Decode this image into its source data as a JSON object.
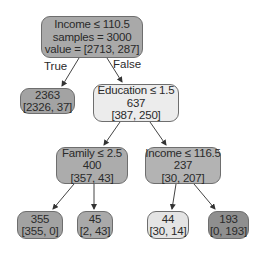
{
  "diagram": {
    "type": "decision-tree",
    "edge_labels": {
      "true": "True",
      "false": "False"
    },
    "colors": {
      "root": "#a9a9a9",
      "leaf_left": "#a3a3a3",
      "education": "#ececec",
      "family": "#acacac",
      "income2": "#b3b3b3",
      "leaf_355": "#a2a2a2",
      "leaf_45": "#a9a9a9",
      "leaf_44": "#e4e4e4",
      "leaf_193": "#8f8f8f",
      "border": "#6e6e6e",
      "edge": "#444444"
    },
    "nodes": {
      "root": {
        "line1": "Income ≤ 110.5",
        "line2": "samples = 3000",
        "line3": "value = [2713, 287]"
      },
      "leaf_left": {
        "line1": "2363",
        "line2": "[2326, 37]"
      },
      "education": {
        "line1": "Education ≤ 1.5",
        "line2": "637",
        "line3": "[387, 250]"
      },
      "family": {
        "line1": "Family ≤ 2.5",
        "line2": "400",
        "line3": "[357, 43]"
      },
      "income2": {
        "line1": "Income ≤ 116.5",
        "line2": "237",
        "line3": "[30, 207]"
      },
      "leaf_355": {
        "line1": "355",
        "line2": "[355, 0]"
      },
      "leaf_45": {
        "line1": "45",
        "line2": "[2, 43]"
      },
      "leaf_44": {
        "line1": "44",
        "line2": "[30, 14]"
      },
      "leaf_193": {
        "line1": "193",
        "line2": "[0, 193]"
      }
    }
  }
}
